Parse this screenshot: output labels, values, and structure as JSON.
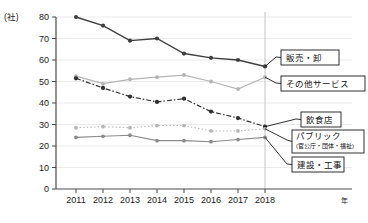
{
  "chart_data": {
    "type": "line",
    "title": "",
    "xlabel": "年",
    "ylabel": "(社)",
    "y_unit": "(社)",
    "x_unit": "年",
    "grid": true,
    "legend_position": "right-callouts",
    "ylim": [
      0,
      80
    ],
    "yticks": [
      0,
      10,
      20,
      30,
      40,
      50,
      60,
      70,
      80
    ],
    "categories": [
      "2011",
      "2012",
      "2013",
      "2014",
      "2015",
      "2016",
      "2017",
      "2018"
    ],
    "series": [
      {
        "name": "販売・卸",
        "style": "solid-dark",
        "color": "#3f3f3f",
        "values": [
          80,
          76,
          69,
          70,
          63,
          61,
          60,
          57
        ]
      },
      {
        "name": "その他サービス",
        "style": "solid-light",
        "color": "#b5b5b5",
        "values": [
          52.5,
          49,
          51,
          52,
          53,
          50,
          46.5,
          52
        ]
      },
      {
        "name": "飲食店",
        "style": "dash-dot-dark",
        "color": "#2f2f2f",
        "values": [
          51.5,
          47,
          43,
          40.5,
          42,
          36,
          33,
          29
        ]
      },
      {
        "name": "パブリック",
        "sub_name": "(官公庁・団体・福祉)",
        "style": "dotted-light",
        "color": "#b5b5b5",
        "values": [
          28.5,
          29,
          28.5,
          29.5,
          29.5,
          27,
          27,
          28
        ]
      },
      {
        "name": "建設・工事",
        "style": "solid-mid",
        "color": "#8a8a8a",
        "values": [
          24,
          24.5,
          25,
          22.5,
          22.5,
          22,
          23,
          24
        ]
      }
    ]
  },
  "callouts": [
    {
      "id": "hanbai",
      "label": "販売・卸",
      "sub": ""
    },
    {
      "id": "sonota",
      "label": "その他サービス",
      "sub": ""
    },
    {
      "id": "inshoku",
      "label": "飲食店",
      "sub": ""
    },
    {
      "id": "public",
      "label": "パブリック",
      "sub": "(官公庁・団体・福祉)"
    },
    {
      "id": "kensetsu",
      "label": "建設・工事",
      "sub": ""
    }
  ]
}
